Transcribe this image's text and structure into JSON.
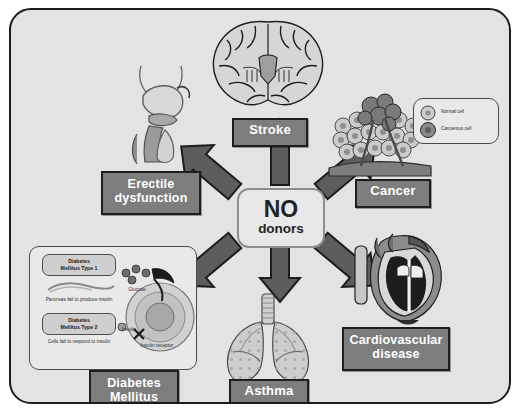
{
  "figure": {
    "hub": {
      "line1": "NO",
      "line2": "donors"
    },
    "panel_color": "#e3e3e3",
    "label_color": "#7d7d7d",
    "label_text_color": "#ffffff"
  },
  "conditions": [
    {
      "id": "stroke",
      "label": "Stroke",
      "icon": "brain-coronal-section",
      "direction": "up"
    },
    {
      "id": "cancer",
      "label": "Cancer",
      "icon": "tumor-cells",
      "direction": "upper-right"
    },
    {
      "id": "cardiovascular",
      "label": "Cardiovascular\ndisease",
      "icon": "heart-cross-section",
      "direction": "lower-right"
    },
    {
      "id": "asthma",
      "label": "Asthma",
      "icon": "lungs",
      "direction": "down"
    },
    {
      "id": "diabetes",
      "label": "Diabetes\nMellitus",
      "icon": "insulin-cell-panel",
      "direction": "lower-left"
    },
    {
      "id": "erectile",
      "label": "Erectile\ndysfunction",
      "icon": "male-reproductive-tract",
      "direction": "upper-left"
    }
  ],
  "labels": {
    "stroke": "Stroke",
    "cancer": "Cancer",
    "cardiovascular_l1": "Cardiovascular",
    "cardiovascular_l2": "disease",
    "asthma": "Asthma",
    "diabetes_l1": "Diabetes",
    "diabetes_l2": "Mellitus",
    "erectile_l1": "Erectile",
    "erectile_l2": "dysfunction"
  },
  "cancer_legend": {
    "normal_cell": "Normal cell",
    "cancerous_cell": "Cancerous cell"
  },
  "diabetes_inset": {
    "type1_box": "Diabetes\nMellitus Type 1",
    "type1_box_l1": "Diabetes",
    "type1_box_l2": "Mellitus Type 1",
    "type1_caption": "Pancreas fail to produce insulin",
    "type2_box_l1": "Diabetes",
    "type2_box_l2": "Mellitus Type 2",
    "type2_caption": "Cells fail to respond to insulin",
    "glucose": "Glucose",
    "insulin": "Insulin",
    "insulin_receptor": "Insulin receptor"
  }
}
